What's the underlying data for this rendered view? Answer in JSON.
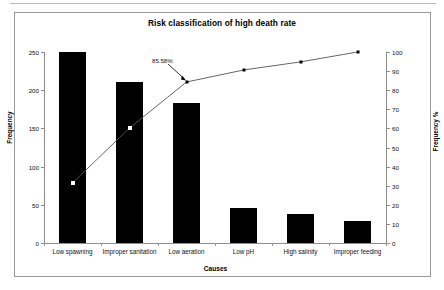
{
  "chart_data": {
    "type": "bar",
    "title": "Risk classification of high death rate",
    "xlabel": "Causes",
    "ylabel": "Frequency",
    "ylabel_secondary": "Frequency %",
    "categories": [
      "Low spawning",
      "Improper sanitation",
      "Low aeration",
      "Low pH",
      "High salinity",
      "Improper feeding"
    ],
    "values": [
      250,
      211,
      183,
      46,
      38,
      29
    ],
    "ylim": [
      0,
      250
    ],
    "yticks": [
      0,
      50,
      100,
      150,
      200,
      250
    ],
    "ylim_secondary": [
      0,
      100
    ],
    "yticks_secondary": [
      0,
      10,
      20,
      30,
      40,
      50,
      60,
      70,
      80,
      90,
      100
    ],
    "series": [
      {
        "name": "Frequency",
        "type": "bar",
        "values": [
          250,
          211,
          183,
          46,
          38,
          29
        ],
        "color": "#000000",
        "axis": "left"
      },
      {
        "name": "Cumulative Frequency %",
        "type": "line",
        "values": [
          31.4,
          60.2,
          84.3,
          90.6,
          94.8,
          100.0
        ],
        "color": "#555555",
        "axis": "right"
      }
    ],
    "annotations": [
      {
        "text": "85.58%",
        "points_to_category": "Low aeration",
        "value": 84.3
      }
    ],
    "grid": false,
    "legend": "none"
  },
  "axis": {
    "left_ticks": [
      "250",
      "200",
      "150",
      "100",
      "50",
      "0"
    ],
    "right_ticks": [
      "100",
      "90",
      "80",
      "70",
      "60",
      "50",
      "40",
      "30",
      "20",
      "10",
      "0"
    ],
    "left_title": "Frequency",
    "right_title": "Frequency %",
    "x_title": "Causes"
  },
  "title": "Risk classification of high death rate",
  "annotation_label": "85.58%"
}
